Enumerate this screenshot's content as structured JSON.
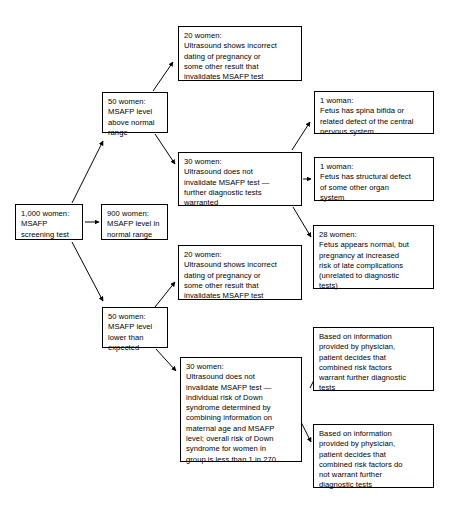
{
  "diagram": {
    "stroke_color": "#000000",
    "background_color": "#ffffff",
    "nodes": {
      "screening": "1,000 women:\nMSAFP\nscreening test",
      "high_level": "50 women:\nMSAFP level\nabove normal\nrange",
      "normal_level": "900 women:\nMSAFP level in\nnormal range",
      "low_level": "50 women:\nMSAFP level\nlower than\nexpected",
      "ultrasound_high_invalid": "20 women:\nUltrasound shows incorrect\ndating of pregnancy or\nsome other result that\ninvalidates MSAFP test",
      "ultrasound_high_valid": "30 women:\nUltrasound does not\ninvalidate MSAFP test —\nfurther diagnostic tests\nwarranted",
      "ultrasound_low_invalid": "20 women:\nUltrasound shows incorrect\ndating of pregnancy or\nsome other result that\ninvalidates MSAFP test",
      "ultrasound_low_valid": "30 women:\nUltrasound does not\ninvalidate MSAFP test —\nindividual risk of Down\nsyndrome determined by\ncombining information on\nmaternal age and MSAFP\nlevel; overall risk of Down\nsyndrome for women in\ngroup is less than 1 in 270",
      "spina_bifida": "1 woman:\nFetus has spina bifida or\nrelated defect of the central\nnervous system",
      "structural_defect": "1 woman:\nFetus has structural defect\nof some other organ\nsystem",
      "late_complications": "28 women:\nFetus appears normal, but\npregnancy at increased\nrisk of late complications\n(unrelated to diagnostic\ntests)",
      "decision_warrant": "Based on information\nprovided by physician,\npatient decides that\ncombined risk factors\nwarrant further diagnostic\ntests",
      "decision_not_warrant": "Based on information\nprovided by physician,\npatient decides that\ncombined risk factors do\nnot warrant further\ndiagnostic tests"
    },
    "edges": [
      {
        "from": "screening",
        "to": "normal_level"
      },
      {
        "from": "screening",
        "to": "high_level"
      },
      {
        "from": "screening",
        "to": "low_level"
      },
      {
        "from": "high_level",
        "to": "ultrasound_high_invalid"
      },
      {
        "from": "high_level",
        "to": "ultrasound_high_valid"
      },
      {
        "from": "ultrasound_high_valid",
        "to": "spina_bifida"
      },
      {
        "from": "ultrasound_high_valid",
        "to": "structural_defect"
      },
      {
        "from": "ultrasound_high_valid",
        "to": "late_complications"
      },
      {
        "from": "low_level",
        "to": "ultrasound_low_invalid"
      },
      {
        "from": "low_level",
        "to": "ultrasound_low_valid"
      },
      {
        "from": "ultrasound_low_valid",
        "to": "decision_warrant"
      },
      {
        "from": "ultrasound_low_valid",
        "to": "decision_not_warrant"
      }
    ]
  }
}
